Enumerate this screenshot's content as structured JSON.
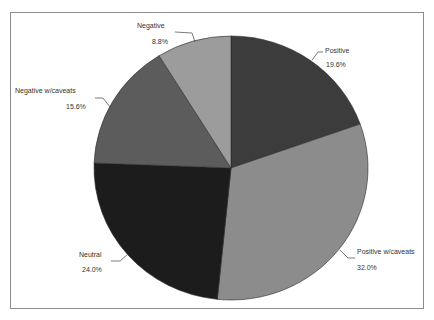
{
  "chart_data": {
    "type": "pie",
    "title": "",
    "start_angle": "12 o'clock",
    "direction": "clockwise",
    "categories": [
      "Positive",
      "Positive w/caveats",
      "Neutral",
      "Negative w/caveats",
      "Negative"
    ],
    "values": [
      19.6,
      32.0,
      24.0,
      15.6,
      8.8
    ],
    "labels": [
      {
        "name": "Positive",
        "pct": "19.6%"
      },
      {
        "name": "Positive w/caveats",
        "pct": "32.0%"
      },
      {
        "name": "Neutral",
        "pct": "24.0%"
      },
      {
        "name": "Negative w/caveats",
        "pct": "15.6%"
      },
      {
        "name": "Negative",
        "pct": "8.8%"
      }
    ],
    "colors": [
      "#3c3c3c",
      "#8c8c8c",
      "#1c1c1c",
      "#5c5c5c",
      "#9c9c9c"
    ],
    "legend": "none (data labels with leader lines)"
  }
}
